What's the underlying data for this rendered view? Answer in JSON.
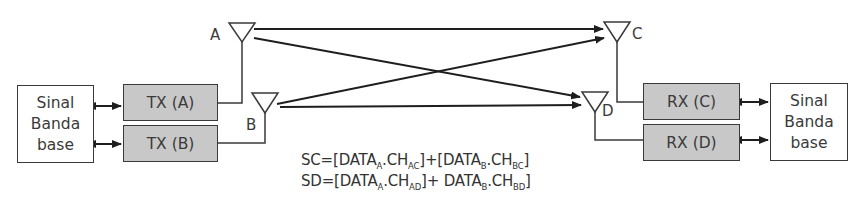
{
  "diagram": {
    "type": "MIMO 2x2 block diagram",
    "left_baseband": {
      "lines": [
        "Sinal",
        "Banda",
        "base"
      ]
    },
    "right_baseband": {
      "lines": [
        "Sinal",
        "Banda",
        "base"
      ]
    },
    "transmitters": [
      {
        "label": "TX (A)",
        "antenna": "A"
      },
      {
        "label": "TX (B)",
        "antenna": "B"
      }
    ],
    "receivers": [
      {
        "label": "RX (C)",
        "antenna": "C"
      },
      {
        "label": "RX (D)",
        "antenna": "D"
      }
    ],
    "antenna_labels": {
      "a": "A",
      "b": "B",
      "c": "C",
      "d": "D"
    },
    "links": [
      {
        "from": "A",
        "to": "C"
      },
      {
        "from": "A",
        "to": "D"
      },
      {
        "from": "B",
        "to": "C"
      },
      {
        "from": "B",
        "to": "D"
      }
    ],
    "equations": {
      "sc": {
        "lhs": "SC",
        "eq": "=[DATA",
        "sub1": "A",
        "mid1": ".CH",
        "sub2": "AC",
        "plus": "]+[DATA",
        "sub3": "B",
        "mid2": ".CH",
        "sub4": "BC",
        "end": "]"
      },
      "sd": {
        "lhs": "SD",
        "eq": "=[DATA",
        "sub1": "A",
        "mid1": ".CH",
        "sub2": "AD",
        "plus": "]+ DATA",
        "sub3": "B",
        "mid2": ".CH",
        "sub4": "BD",
        "end": "]"
      }
    },
    "colors": {
      "line": "#2a2a2a",
      "radio_fill": "#c8c8c8",
      "baseband_fill": "#ffffff"
    }
  }
}
